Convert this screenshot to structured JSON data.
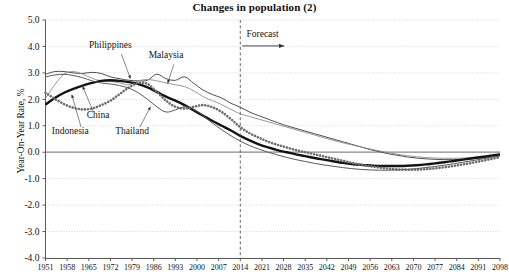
{
  "chart_data": {
    "type": "line",
    "title": "Changes in population (2)",
    "xlabel": "",
    "ylabel": "Year-On-Year Rate, %",
    "ylim": [
      -4.0,
      5.0
    ],
    "xlim": [
      1951,
      2098
    ],
    "grid": true,
    "legend_position": "inline-annotations",
    "ytick_labels": [
      "5.0",
      "4.0",
      "3.0",
      "2.0",
      "1.0",
      "0.0",
      "-1.0",
      "-2.0",
      "-3.0",
      "-4.0"
    ],
    "ytick_values": [
      5.0,
      4.0,
      3.0,
      2.0,
      1.0,
      0.0,
      -1.0,
      -2.0,
      -3.0,
      -4.0
    ],
    "xtick_labels": [
      "1951",
      "1958",
      "1965",
      "1972",
      "1979",
      "1986",
      "1993",
      "2000",
      "2007",
      "2014",
      "2021",
      "2028",
      "2035",
      "2042",
      "2049",
      "2056",
      "2063",
      "2070",
      "2077",
      "2084",
      "2091",
      "2098"
    ],
    "xtick_values": [
      1951,
      1958,
      1965,
      1972,
      1979,
      1986,
      1993,
      2000,
      2007,
      2014,
      2021,
      2028,
      2035,
      2042,
      2049,
      2056,
      2063,
      2070,
      2077,
      2084,
      2091,
      2098
    ],
    "annotations": [
      {
        "text": "Forecast",
        "x": 2016,
        "y": 4.35,
        "kind": "forecast-marker"
      },
      {
        "text": "Philippines",
        "x": 1972,
        "y": 3.95,
        "kind": "series-callout",
        "target_series": "Philippines"
      },
      {
        "text": "Malaysia",
        "x": 1990,
        "y": 3.55,
        "kind": "series-callout",
        "target_series": "Malaysia"
      },
      {
        "text": "China",
        "x": 1968,
        "y": 1.3,
        "kind": "series-callout",
        "target_series": "China"
      },
      {
        "text": "Indonesia",
        "x": 1959,
        "y": 0.7,
        "kind": "series-callout",
        "target_series": "Indonesia"
      },
      {
        "text": "Thailand",
        "x": 1979,
        "y": 0.7,
        "kind": "series-callout",
        "target_series": "Thailand"
      }
    ],
    "forecast_divider_x": 2014,
    "x": [
      1951,
      1954,
      1957,
      1960,
      1963,
      1966,
      1969,
      1972,
      1975,
      1978,
      1981,
      1984,
      1987,
      1990,
      1993,
      1996,
      1999,
      2002,
      2005,
      2008,
      2011,
      2014,
      2017,
      2020,
      2023,
      2026,
      2029,
      2032,
      2035,
      2038,
      2041,
      2044,
      2047,
      2050,
      2053,
      2056,
      2059,
      2062,
      2065,
      2068,
      2071,
      2074,
      2077,
      2080,
      2083,
      2086,
      2089,
      2092,
      2095,
      2098
    ],
    "series": [
      {
        "name": "Philippines",
        "style": "thin-solid-dark",
        "values": [
          2.95,
          3.05,
          3.05,
          3.0,
          2.98,
          3.02,
          2.98,
          2.85,
          2.78,
          2.72,
          2.7,
          2.72,
          2.95,
          2.78,
          2.72,
          2.85,
          2.6,
          2.35,
          2.18,
          2.05,
          1.85,
          1.7,
          1.52,
          1.38,
          1.25,
          1.12,
          1.0,
          0.9,
          0.8,
          0.7,
          0.6,
          0.5,
          0.4,
          0.3,
          0.2,
          0.1,
          0.02,
          -0.06,
          -0.12,
          -0.18,
          -0.22,
          -0.25,
          -0.27,
          -0.28,
          -0.28,
          -0.27,
          -0.25,
          -0.22,
          -0.18,
          -0.13
        ]
      },
      {
        "name": "Malaysia",
        "style": "thin-solid-gray",
        "values": [
          2.05,
          2.55,
          2.95,
          3.05,
          2.95,
          2.8,
          2.7,
          2.68,
          2.62,
          2.55,
          2.7,
          2.75,
          2.7,
          2.62,
          2.55,
          2.48,
          2.32,
          2.1,
          1.95,
          1.8,
          1.62,
          1.45,
          1.35,
          1.25,
          1.15,
          1.05,
          0.95,
          0.85,
          0.75,
          0.65,
          0.55,
          0.45,
          0.36,
          0.28,
          0.2,
          0.12,
          0.05,
          -0.02,
          -0.08,
          -0.13,
          -0.17,
          -0.2,
          -0.22,
          -0.23,
          -0.23,
          -0.22,
          -0.2,
          -0.17,
          -0.13,
          -0.09
        ]
      },
      {
        "name": "China",
        "style": "thick-solid-black",
        "values": [
          1.8,
          2.05,
          2.25,
          2.4,
          2.52,
          2.62,
          2.7,
          2.72,
          2.7,
          2.65,
          2.58,
          2.45,
          2.28,
          2.1,
          1.95,
          1.78,
          1.58,
          1.38,
          1.18,
          1.0,
          0.82,
          0.62,
          0.45,
          0.3,
          0.18,
          0.08,
          0.0,
          -0.08,
          -0.15,
          -0.22,
          -0.28,
          -0.34,
          -0.4,
          -0.45,
          -0.48,
          -0.5,
          -0.52,
          -0.52,
          -0.52,
          -0.51,
          -0.49,
          -0.46,
          -0.42,
          -0.38,
          -0.33,
          -0.28,
          -0.23,
          -0.18,
          -0.13,
          -0.08
        ]
      },
      {
        "name": "Indonesia",
        "style": "thick-beaded-gray",
        "values": [
          2.25,
          2.02,
          1.82,
          1.68,
          1.62,
          1.65,
          1.78,
          1.95,
          2.2,
          2.45,
          2.62,
          2.58,
          2.28,
          1.95,
          1.72,
          1.65,
          1.72,
          1.78,
          1.7,
          1.52,
          1.25,
          0.95,
          0.72,
          0.55,
          0.4,
          0.28,
          0.18,
          0.08,
          0.0,
          -0.08,
          -0.16,
          -0.24,
          -0.32,
          -0.4,
          -0.47,
          -0.53,
          -0.58,
          -0.62,
          -0.65,
          -0.66,
          -0.66,
          -0.64,
          -0.61,
          -0.57,
          -0.52,
          -0.46,
          -0.4,
          -0.33,
          -0.26,
          -0.19
        ]
      },
      {
        "name": "Thailand",
        "style": "thin-solid-mid",
        "values": [
          2.85,
          2.92,
          2.95,
          2.9,
          2.82,
          2.7,
          2.62,
          2.58,
          2.52,
          2.42,
          2.25,
          2.0,
          1.72,
          1.52,
          1.6,
          1.72,
          1.62,
          1.38,
          1.1,
          0.85,
          0.62,
          0.42,
          0.25,
          0.12,
          0.0,
          -0.1,
          -0.2,
          -0.28,
          -0.35,
          -0.42,
          -0.48,
          -0.53,
          -0.58,
          -0.62,
          -0.65,
          -0.67,
          -0.68,
          -0.68,
          -0.67,
          -0.65,
          -0.62,
          -0.58,
          -0.54,
          -0.49,
          -0.44,
          -0.38,
          -0.32,
          -0.26,
          -0.2,
          -0.14
        ]
      }
    ]
  },
  "colors": {
    "axis": "#5a5a5a",
    "grid": "#c9c9d6",
    "zero_line": "#8a8a8a",
    "text": "#111111",
    "philippines": "#3a3a3a",
    "malaysia": "#8c8c8c",
    "china": "#141414",
    "indonesia": "#6e6e6e",
    "thailand": "#585858"
  }
}
